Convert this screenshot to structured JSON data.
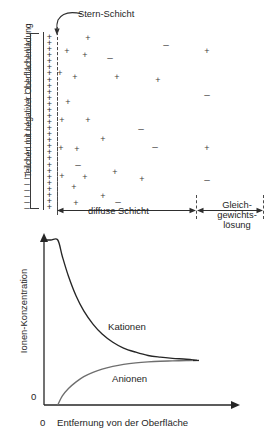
{
  "figure": {
    "title_hidden": "",
    "top_panel": {
      "surface_charge_caption": "Teilchen mit negativer Oberflächenladung",
      "stern_layer_label": "Stern-Schicht",
      "diffuse_layer_label": "diffuse Schicht",
      "equilibrium_label_lines": [
        "Gleich-",
        "gewichts-",
        "lösung"
      ],
      "cation_symbol": "+",
      "anion_symbol": "–",
      "surface_charge_symbol": "–",
      "stern_cation_count": 29,
      "surface_minus_count": 29,
      "ion_color": "#3d3d3d",
      "line_color": "#3a3a3a"
    },
    "plot": {
      "ylabel": "Ionen-Konzentration",
      "xlabel": "Entfernung von der Oberfläche",
      "y_origin_tick": "0",
      "x_origin_tick": "0",
      "cation_curve_label": "Kationen",
      "anion_curve_label": "Anionen",
      "curve_color": "#262626",
      "anion_curve_color": "#6e6e6e"
    }
  },
  "chart_data": {
    "type": "line",
    "xlabel": "Entfernung von der Oberfläche",
    "ylabel": "Ionen-Konzentration",
    "xlim": [
      0,
      1
    ],
    "ylim": [
      0,
      1
    ],
    "xticks": [
      0
    ],
    "xticklabels": [
      "0"
    ],
    "yticks": [
      0
    ],
    "yticklabels": [
      "0"
    ],
    "grid": false,
    "legend": "inline-annotation",
    "annotations": [
      "Kationen",
      "Anionen"
    ],
    "bulk_concentration": 0.27,
    "stern_layer_end_x": 0.09,
    "series": [
      {
        "name": "Kationen",
        "x": [
          0.0,
          0.045,
          0.09,
          0.12,
          0.16,
          0.21,
          0.26,
          0.32,
          0.38,
          0.45,
          0.52,
          0.6,
          0.68,
          0.76,
          0.84,
          0.93,
          1.0
        ],
        "y": [
          1.0,
          1.0,
          1.0,
          0.9,
          0.78,
          0.66,
          0.57,
          0.49,
          0.43,
          0.38,
          0.345,
          0.32,
          0.3,
          0.29,
          0.283,
          0.277,
          0.27
        ]
      },
      {
        "name": "Anionen",
        "x": [
          0.09,
          0.12,
          0.16,
          0.21,
          0.26,
          0.32,
          0.38,
          0.45,
          0.52,
          0.6,
          0.68,
          0.76,
          0.84,
          0.93,
          1.0
        ],
        "y": [
          0.0,
          0.055,
          0.1,
          0.14,
          0.172,
          0.198,
          0.218,
          0.234,
          0.246,
          0.255,
          0.261,
          0.265,
          0.267,
          0.269,
          0.27
        ]
      }
    ]
  },
  "ions": [
    {
      "sym": "+",
      "x": 88,
      "y": 38
    },
    {
      "sym": "+",
      "x": 67,
      "y": 51
    },
    {
      "sym": "+",
      "x": 85,
      "y": 55
    },
    {
      "sym": "–",
      "x": 110,
      "y": 58
    },
    {
      "sym": "–",
      "x": 166,
      "y": 45
    },
    {
      "sym": "+",
      "x": 207,
      "y": 51
    },
    {
      "sym": "+",
      "x": 60,
      "y": 73
    },
    {
      "sym": "+",
      "x": 75,
      "y": 77
    },
    {
      "sym": "+",
      "x": 117,
      "y": 77
    },
    {
      "sym": "+",
      "x": 158,
      "y": 80
    },
    {
      "sym": "–",
      "x": 207,
      "y": 95
    },
    {
      "sym": "+",
      "x": 68,
      "y": 102
    },
    {
      "sym": "+",
      "x": 62,
      "y": 120
    },
    {
      "sym": "+",
      "x": 88,
      "y": 120
    },
    {
      "sym": "–",
      "x": 141,
      "y": 129
    },
    {
      "sym": "+",
      "x": 103,
      "y": 139
    },
    {
      "sym": "–",
      "x": 155,
      "y": 147
    },
    {
      "sym": "+",
      "x": 61,
      "y": 148
    },
    {
      "sym": "+",
      "x": 77,
      "y": 149
    },
    {
      "sym": "+",
      "x": 207,
      "y": 148
    },
    {
      "sym": "–",
      "x": 78,
      "y": 165
    },
    {
      "sym": "+",
      "x": 115,
      "y": 172
    },
    {
      "sym": "+",
      "x": 62,
      "y": 176
    },
    {
      "sym": "+",
      "x": 85,
      "y": 177
    },
    {
      "sym": "+",
      "x": 142,
      "y": 179
    },
    {
      "sym": "+",
      "x": 74,
      "y": 187
    },
    {
      "sym": "–",
      "x": 207,
      "y": 180
    },
    {
      "sym": "+",
      "x": 76,
      "y": 203
    },
    {
      "sym": "–",
      "x": 118,
      "y": 202
    },
    {
      "sym": "+",
      "x": 103,
      "y": 196
    }
  ]
}
